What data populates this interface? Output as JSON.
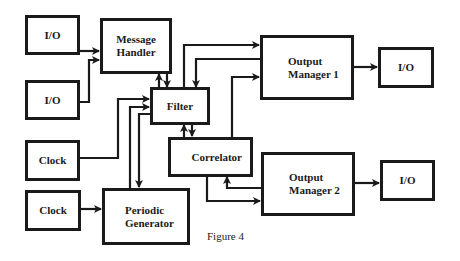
{
  "diagram": {
    "caption": "Figure 4",
    "nodes": {
      "io_left_top": {
        "label": "I/O"
      },
      "io_left_bottom": {
        "label": "I/O"
      },
      "message_handler": {
        "label": "Message\nHandler"
      },
      "filter": {
        "label": "Filter"
      },
      "clock_top": {
        "label": "Clock"
      },
      "clock_bottom": {
        "label": "Clock"
      },
      "periodic_generator": {
        "label": "Periodic\nGenerator"
      },
      "correlator": {
        "label": "Correlator"
      },
      "output_manager_1": {
        "label": "Output\nManager 1"
      },
      "output_manager_2": {
        "label": "Output\nManager 2"
      },
      "io_right_top": {
        "label": "I/O"
      },
      "io_right_bottom": {
        "label": "I/O"
      }
    },
    "edges": [
      {
        "from": "I/O (left top)",
        "to": "Message Handler"
      },
      {
        "from": "I/O (left bottom)",
        "to": "Message Handler"
      },
      {
        "from": "Message Handler",
        "to": "Filter",
        "bidirectional": true
      },
      {
        "from": "Filter",
        "to": "Output Manager 1"
      },
      {
        "from": "Output Manager 1",
        "to": "Filter"
      },
      {
        "from": "Correlator",
        "to": "Output Manager 1"
      },
      {
        "from": "Clock (top)",
        "to": "Filter"
      },
      {
        "from": "Periodic Generator",
        "to": "Filter"
      },
      {
        "from": "Filter",
        "to": "Periodic Generator"
      },
      {
        "from": "Filter",
        "to": "Correlator",
        "bidirectional": true
      },
      {
        "from": "Correlator",
        "to": "Output Manager 2"
      },
      {
        "from": "Output Manager 2",
        "to": "Correlator"
      },
      {
        "from": "Clock (bottom)",
        "to": "Periodic Generator"
      },
      {
        "from": "Output Manager 1",
        "to": "I/O (right top)"
      },
      {
        "from": "Output Manager 2",
        "to": "I/O (right bottom)"
      }
    ]
  }
}
